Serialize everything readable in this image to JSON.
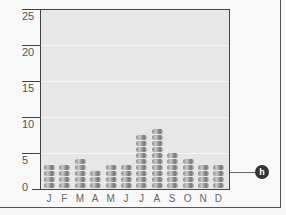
{
  "chart_data": {
    "type": "bar",
    "style": "stacked-coin pictograph",
    "title": "",
    "xlabel": "",
    "ylabel": "",
    "categories": [
      "J",
      "F",
      "M",
      "A",
      "M",
      "J",
      "J",
      "A",
      "S",
      "O",
      "N",
      "D"
    ],
    "values": [
      4,
      4,
      5,
      3,
      4,
      4,
      9,
      10,
      6,
      5,
      4,
      4
    ],
    "ylim": [
      0,
      25
    ],
    "yticks": [
      "0",
      "5",
      "10",
      "15",
      "20",
      "25"
    ],
    "grid": true,
    "annotation": {
      "label": "h",
      "target_category_index": 11
    }
  },
  "colors": {
    "plot_bg": "#e7e7e7",
    "grid": "#f6f6f6",
    "axis": "#444444",
    "badge": "#333333"
  }
}
